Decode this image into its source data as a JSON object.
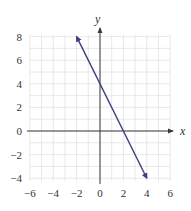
{
  "chart_data": {
    "type": "line",
    "title": "",
    "xlabel": "x",
    "ylabel": "y",
    "xlim": [
      -6,
      6
    ],
    "ylim": [
      -4,
      8
    ],
    "grid": true,
    "x_ticks": [
      "−6",
      "−4",
      "−2",
      "0",
      "2",
      "4",
      "6"
    ],
    "y_ticks": [
      "8",
      "6",
      "4",
      "2",
      "0",
      "−2",
      "−4"
    ],
    "series": [
      {
        "name": "y = -2x + 4",
        "x": [
          -2,
          4
        ],
        "y": [
          8,
          -4
        ],
        "arrows": "both",
        "color": "#3b3f7c"
      }
    ],
    "annotations": []
  },
  "colors": {
    "line": "#3b3f7c",
    "axis": "#3a3a3a",
    "grid": "#e2e2e2",
    "text": "#333333"
  },
  "labels": {
    "x_axis": "x",
    "y_axis": "y"
  }
}
